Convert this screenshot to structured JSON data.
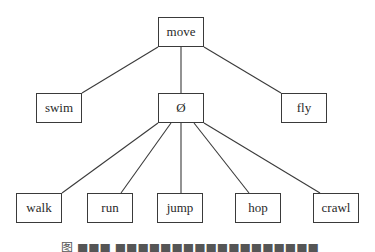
{
  "diagram": {
    "type": "tree",
    "line_color": "#3a3a3a",
    "nodes": [
      {
        "id": "move",
        "label": "move",
        "x": 158,
        "y": 17
      },
      {
        "id": "swim",
        "label": "swim",
        "x": 36,
        "y": 93
      },
      {
        "id": "null",
        "label": "Ø",
        "x": 158,
        "y": 93
      },
      {
        "id": "fly",
        "label": "fly",
        "x": 281,
        "y": 93
      },
      {
        "id": "walk",
        "label": "walk",
        "x": 16,
        "y": 193
      },
      {
        "id": "run",
        "label": "run",
        "x": 87,
        "y": 193
      },
      {
        "id": "jump",
        "label": "jump",
        "x": 157,
        "y": 193
      },
      {
        "id": "hop",
        "label": "hop",
        "x": 235,
        "y": 193
      },
      {
        "id": "crawl",
        "label": "crawl",
        "x": 313,
        "y": 193
      }
    ],
    "edges": [
      {
        "from": "move",
        "to": "swim",
        "x1": 158,
        "y1": 47,
        "x2": 82,
        "y2": 93
      },
      {
        "from": "move",
        "to": "null",
        "x1": 181,
        "y1": 47,
        "x2": 181,
        "y2": 93
      },
      {
        "from": "move",
        "to": "fly",
        "x1": 204,
        "y1": 47,
        "x2": 281,
        "y2": 93
      },
      {
        "from": "null",
        "to": "walk",
        "x1": 158,
        "y1": 123,
        "x2": 62,
        "y2": 193
      },
      {
        "from": "null",
        "to": "run",
        "x1": 171,
        "y1": 123,
        "x2": 121,
        "y2": 193
      },
      {
        "from": "null",
        "to": "jump",
        "x1": 181,
        "y1": 123,
        "x2": 181,
        "y2": 193
      },
      {
        "from": "null",
        "to": "hop",
        "x1": 194,
        "y1": 123,
        "x2": 249,
        "y2": 193
      },
      {
        "from": "null",
        "to": "crawl",
        "x1": 204,
        "y1": 123,
        "x2": 320,
        "y2": 193
      }
    ]
  },
  "caption": {
    "text": "图 ■■■ ■■■■■■■■■■■■■■■■■■"
  }
}
